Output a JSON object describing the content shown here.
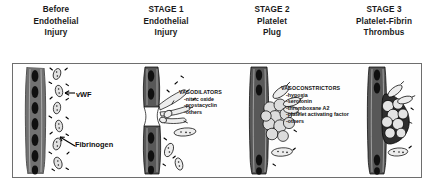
{
  "headers": [
    {
      "name": "before-injury",
      "lines": [
        "Before",
        "Endothelial",
        "Injury"
      ]
    },
    {
      "name": "stage-1",
      "lines": [
        "STAGE 1",
        "Endothelial",
        "Injury"
      ]
    },
    {
      "name": "stage-2",
      "lines": [
        "STAGE 2",
        "Platelet",
        "Plug"
      ]
    },
    {
      "name": "stage-3",
      "lines": [
        "STAGE 3",
        "Platelet-Fibrin",
        "Thrombus"
      ]
    }
  ],
  "callouts": {
    "vwf": "vWF",
    "fibrinogen": "Fibrinogen"
  },
  "mediators": {
    "vasodilators": {
      "title": "VASODILATORS",
      "items": [
        "-nitric oxide",
        "-prostacyclin",
        "-others"
      ]
    },
    "vasoconstrictors": {
      "title": "VASOCONSTRICTORS",
      "items": [
        "-hypoxia",
        "-serotonin",
        "-thromboxane A2",
        "-platelet activating factor",
        "-others"
      ]
    }
  },
  "colors": {
    "ink": "#000000",
    "border": "#6e6e6e",
    "header_text": "#1a1a1a",
    "vessel_wall_fill": "#4a4a4a",
    "platelet_fill": "#d8d8d8",
    "thrombus_fill": "#2b2b2b",
    "background": "#ffffff"
  },
  "figures": [
    {
      "name": "figure-before-injury",
      "caption": "intact endothelial wall with free-floating platelets"
    },
    {
      "name": "figure-stage-1",
      "caption": "endothelial injury with platelet adhesion at wall defect"
    },
    {
      "name": "figure-stage-2",
      "caption": "aggregated platelet plug at injury site"
    },
    {
      "name": "figure-stage-3",
      "caption": "dense platelet-fibrin thrombus"
    }
  ]
}
